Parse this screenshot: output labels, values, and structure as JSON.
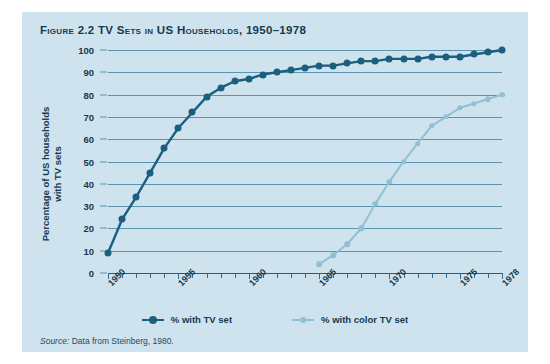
{
  "figure": {
    "number": "Figure 2.2",
    "title": "TV Sets in US Households, 1950–1978",
    "full_title": "Figure 2.2 TV Sets in US Households, 1950–1978",
    "source_label": "Source:",
    "source_text": "Data from Steinberg, 1980."
  },
  "colors": {
    "panel_background": "#cfe3ee",
    "page_background": "#ffffff",
    "gridline": "#5d93ad",
    "axis": "#1d5d7e",
    "text": "#16394d",
    "series_tv": "#1a5f7e",
    "series_color_tv": "#8fc0d6"
  },
  "legend": {
    "position": "bottom-center",
    "items": [
      {
        "label": "% with TV set",
        "color": "#1a5f7e"
      },
      {
        "label": "% with color TV set",
        "color": "#8fc0d6"
      }
    ]
  },
  "chart_data": {
    "type": "line",
    "title": "TV Sets in US Households, 1950–1978",
    "xlabel": "",
    "ylabel": "Percentage of US households with TV sets",
    "xlim": [
      1950,
      1978
    ],
    "ylim": [
      0,
      100
    ],
    "grid": true,
    "y_ticks": [
      0,
      10,
      20,
      30,
      40,
      50,
      60,
      70,
      80,
      90,
      100
    ],
    "y_tick_labels": [
      "0",
      "10",
      "20",
      "30",
      "40",
      "50",
      "60",
      "70",
      "80",
      "90",
      "100"
    ],
    "x_ticks": [
      1950,
      1951,
      1952,
      1953,
      1954,
      1955,
      1956,
      1957,
      1958,
      1959,
      1960,
      1961,
      1962,
      1963,
      1964,
      1965,
      1966,
      1967,
      1968,
      1969,
      1970,
      1971,
      1972,
      1973,
      1974,
      1975,
      1976,
      1977,
      1978
    ],
    "x_tick_labels": [
      "1950",
      "1955",
      "1960",
      "1965",
      "1970",
      "1975",
      "1978"
    ],
    "x_labeled_ticks": [
      1950,
      1955,
      1960,
      1965,
      1970,
      1975,
      1978
    ],
    "series": [
      {
        "name": "% with TV set",
        "color": "#1a5f7e",
        "x": [
          1950,
          1951,
          1952,
          1953,
          1954,
          1955,
          1956,
          1957,
          1958,
          1959,
          1960,
          1961,
          1962,
          1963,
          1964,
          1965,
          1966,
          1967,
          1968,
          1969,
          1970,
          1971,
          1972,
          1973,
          1974,
          1975,
          1976,
          1977,
          1978
        ],
        "values": [
          9,
          24,
          34,
          45,
          56,
          65,
          72,
          79,
          83,
          86,
          87,
          89,
          90,
          91,
          92,
          93,
          93,
          94,
          95,
          95,
          96,
          96,
          96,
          97,
          97,
          97,
          98,
          99,
          100
        ]
      },
      {
        "name": "% with color TV set",
        "color": "#8fc0d6",
        "x": [
          1965,
          1966,
          1967,
          1968,
          1969,
          1970,
          1971,
          1972,
          1973,
          1974,
          1975,
          1976,
          1977,
          1978
        ],
        "values": [
          4,
          8,
          13,
          20,
          31,
          41,
          50,
          58,
          66,
          70,
          74,
          76,
          78,
          80
        ]
      }
    ]
  }
}
